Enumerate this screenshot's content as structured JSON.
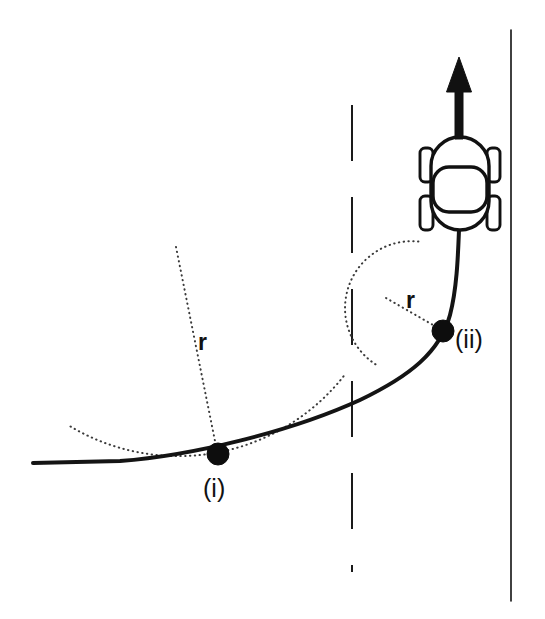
{
  "figure": {
    "background_color": "#ffffff",
    "width": 545,
    "height": 619
  },
  "labels": {
    "radius_large": "r",
    "radius_small": "r",
    "point_one": "(i)",
    "point_two": "(ii)"
  },
  "colors": {
    "line": "#111111",
    "dotted": "#3a3a3a",
    "dot": "#0d0d0d",
    "background": "#ffffff"
  },
  "elements": {
    "car_name": "car-top-view",
    "arrow_name": "direction-of-travel-arrow",
    "road_inner_name": "road-inner-curve",
    "road_center_name": "road-center-dashed-line",
    "road_outer_name": "road-outer-straight-edge"
  },
  "geometry": {
    "point_one": {
      "x": 218,
      "y": 454,
      "r_dot": 11
    },
    "point_two": {
      "x": 443,
      "y": 331,
      "r_dot": 11
    },
    "circle_large": {
      "cx": 176,
      "cy": 247,
      "radius": 211
    },
    "circle_small": {
      "cx": 386,
      "cy": 298,
      "radius": 67
    },
    "center_line_x": 352,
    "outer_edge_x": 511,
    "arrow_tip": {
      "x": 459,
      "y": 57
    },
    "car_center": {
      "x": 460,
      "y": 183
    }
  },
  "annotations": {
    "description": "A road curve with two marked points (i) and (ii); at each point a dotted osculating circle and its radius r are drawn, showing a larger radius at (i) and a smaller radius at (ii). A car travels upward along the road, indicated by a solid arrow."
  }
}
